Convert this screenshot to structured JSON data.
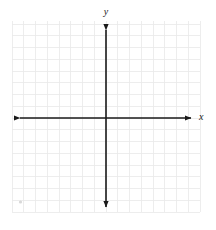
{
  "chart_data": {
    "type": "scatter",
    "title": "",
    "subtitle": "",
    "xlabel": "x",
    "ylabel": "y",
    "x": [],
    "y": [],
    "series": [],
    "annotations": [],
    "legend": null,
    "legend_position": "none",
    "grid": true,
    "grid_step": 1,
    "xlim": [
      -8,
      8
    ],
    "ylim": [
      -8,
      8
    ],
    "xticks": [
      -8,
      -7,
      -6,
      -5,
      -4,
      -3,
      -2,
      -1,
      0,
      1,
      2,
      3,
      4,
      5,
      6,
      7,
      8
    ],
    "yticks": [
      -8,
      -7,
      -6,
      -5,
      -4,
      -3,
      -2,
      -1,
      0,
      1,
      2,
      3,
      4,
      5,
      6,
      7,
      8
    ],
    "tick_labels_visible": false,
    "origin_label": ""
  },
  "axes": {
    "x_axis_label": "x",
    "y_axis_label": "y",
    "x_axis_arrows": "both",
    "y_axis_arrows": "both"
  },
  "colors": {
    "background": "#ffffff",
    "grid_line": "#e8e8e8",
    "grid_line_major": "#e0e0e0",
    "axis": "#1a1a1a",
    "label": "#1a1a1a",
    "mark": "#d8d8d8"
  },
  "geometry": {
    "origin_x": 106,
    "origin_y": 118,
    "cell_size": 11.75,
    "grid_left": 12,
    "grid_right": 200,
    "grid_top": 21,
    "grid_bottom": 212,
    "x_axis_start": 14,
    "x_axis_end": 197,
    "y_axis_start": 24,
    "y_axis_end": 213
  }
}
